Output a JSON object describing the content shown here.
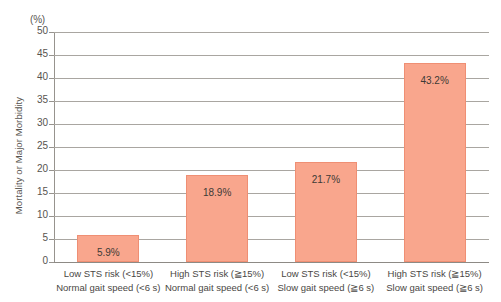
{
  "chart_data": {
    "type": "bar",
    "title": "",
    "xlabel": "",
    "ylabel": "Mortality or Major Morbidity",
    "unit_label": "(%)",
    "ylim": [
      0,
      50
    ],
    "ytick_step": 5,
    "grid": true,
    "legend": "none",
    "bar_color": "#f9a68d",
    "bar_border_color": "#ef8f74",
    "yticks": [
      "50",
      "45",
      "40",
      "35",
      "30",
      "25",
      "20",
      "15",
      "10",
      "5",
      "0"
    ],
    "ytick_values": [
      50,
      45,
      40,
      35,
      30,
      25,
      20,
      15,
      10,
      5,
      0
    ],
    "categories": [
      "Low STS risk (<15%) / Normal gait speed (<6 s)",
      "High STS risk (≧15%) / Normal gait speed (<6 s)",
      "Low STS risk (<15%) / Slow gait speed (≧6 s)",
      "High STS risk (≧15%) / Slow gait speed (≧6 s)"
    ],
    "category_lines": [
      [
        "Low STS risk (<15%)",
        "Normal gait speed (<6 s)"
      ],
      [
        "High STS risk (≧15%)",
        "Normal gait speed (<6 s)"
      ],
      [
        "Low STS risk (<15%)",
        "Slow gait speed (≧6 s)"
      ],
      [
        "High STS risk (≧15%)",
        "Slow gait speed (≧6 s)"
      ]
    ],
    "values": [
      5.9,
      18.9,
      21.7,
      43.2
    ],
    "value_labels": [
      "5.9%",
      "18.9%",
      "21.7%",
      "43.2%"
    ]
  }
}
